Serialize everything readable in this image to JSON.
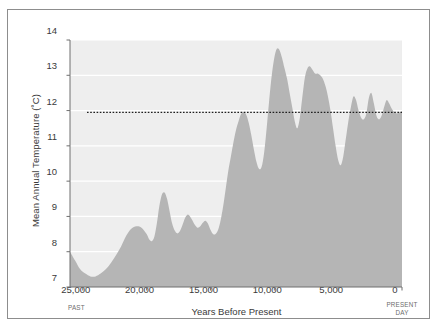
{
  "chart_data": {
    "type": "area",
    "title": "",
    "xlabel": "Years Before Present",
    "ylabel": "Mean Annual Temperature (˚C)",
    "ylim": [
      7,
      14
    ],
    "xlim": [
      26000,
      0
    ],
    "x_axis_inverted": true,
    "grid": "horizontal-white-gridlines",
    "legend": "none",
    "y_ticks": [
      7,
      8,
      9,
      10,
      11,
      12,
      13,
      14
    ],
    "y_tick_labels": [
      "7",
      "8",
      "9",
      "10",
      "11",
      "12",
      "13",
      "14"
    ],
    "x_ticks": [
      25000,
      20000,
      15000,
      10000,
      5000,
      0
    ],
    "x_tick_labels": [
      "25,000",
      "20,000",
      "15,000",
      "10,000",
      "5,000",
      "0"
    ],
    "axis_end_notes": {
      "left": "PAST",
      "right": "PRESENT\nDAY",
      "right_line1": "PRESENT",
      "right_line2": "DAY"
    },
    "annotations": [
      {
        "label": "Present average annual",
        "type": "reference-line",
        "value": 11.95,
        "style": "dotted",
        "color": "#1f1f1f"
      }
    ],
    "series": [
      {
        "name": "Mean annual temperature",
        "fill_color": "#b5b5b5",
        "background_color": "#ededed",
        "x": [
          26000,
          25600,
          25200,
          24800,
          24400,
          24000,
          23600,
          23200,
          22800,
          22400,
          22000,
          21600,
          21200,
          20800,
          20400,
          20000,
          19800,
          19600,
          19400,
          19200,
          19000,
          18800,
          18600,
          18400,
          18200,
          18000,
          17800,
          17600,
          17400,
          17200,
          17000,
          16800,
          16600,
          16400,
          16200,
          16000,
          15800,
          15600,
          15400,
          15200,
          15000,
          14800,
          14600,
          14400,
          14200,
          14000,
          13800,
          13600,
          13400,
          13200,
          13000,
          12800,
          12600,
          12400,
          12200,
          12000,
          11800,
          11600,
          11400,
          11200,
          11000,
          10800,
          10600,
          10400,
          10200,
          10000,
          9800,
          9600,
          9400,
          9200,
          9000,
          8800,
          8600,
          8400,
          8200,
          8000,
          7800,
          7600,
          7400,
          7200,
          7000,
          6800,
          6600,
          6400,
          6200,
          6000,
          5800,
          5600,
          5400,
          5200,
          5000,
          4800,
          4600,
          4400,
          4200,
          4000,
          3800,
          3600,
          3400,
          3200,
          3000,
          2800,
          2600,
          2400,
          2200,
          2000,
          1800,
          1600,
          1400,
          1200,
          1000,
          800,
          600,
          400,
          200,
          0
        ],
        "y": [
          8.0,
          7.75,
          7.5,
          7.38,
          7.3,
          7.3,
          7.38,
          7.5,
          7.68,
          7.9,
          8.15,
          8.45,
          8.65,
          8.72,
          8.68,
          8.5,
          8.35,
          8.3,
          8.42,
          8.8,
          9.3,
          9.62,
          9.68,
          9.5,
          9.15,
          8.8,
          8.6,
          8.52,
          8.58,
          8.75,
          8.95,
          9.05,
          9.0,
          8.88,
          8.75,
          8.68,
          8.72,
          8.82,
          8.88,
          8.8,
          8.62,
          8.5,
          8.5,
          8.62,
          8.9,
          9.3,
          9.8,
          10.3,
          10.7,
          11.1,
          11.45,
          11.7,
          11.9,
          11.95,
          11.88,
          11.65,
          11.3,
          10.9,
          10.55,
          10.35,
          10.4,
          10.8,
          11.5,
          12.3,
          13.0,
          13.5,
          13.75,
          13.72,
          13.5,
          13.2,
          12.9,
          12.5,
          12.1,
          11.7,
          11.5,
          11.8,
          12.4,
          12.95,
          13.2,
          13.25,
          13.15,
          13.05,
          13.05,
          13.0,
          12.9,
          12.7,
          12.4,
          12.0,
          11.5,
          11.0,
          10.6,
          10.45,
          10.7,
          11.2,
          11.7,
          12.1,
          12.4,
          12.3,
          12.0,
          11.8,
          11.75,
          11.9,
          12.35,
          12.5,
          12.2,
          11.85,
          11.75,
          11.85,
          12.1,
          12.3,
          12.2,
          12.05,
          11.95,
          11.92,
          11.95,
          11.98
        ]
      }
    ]
  },
  "axes": {
    "y_axis_title": "Mean Annual Temperature (˚C)",
    "x_axis_title": "Years Before Present",
    "past_note": "PAST",
    "present_note_line1": "PRESENT",
    "present_note_line2": "DAY",
    "reference_label": "Present average annual"
  },
  "colors": {
    "plot_background": "#ededed",
    "area_fill": "#b5b5b5",
    "gridline": "#ffffff",
    "axis": "#6f6f6f",
    "frame_border": "#8d8d8d",
    "text": "#3a3a3a",
    "reference_line": "#1f1f1f"
  }
}
